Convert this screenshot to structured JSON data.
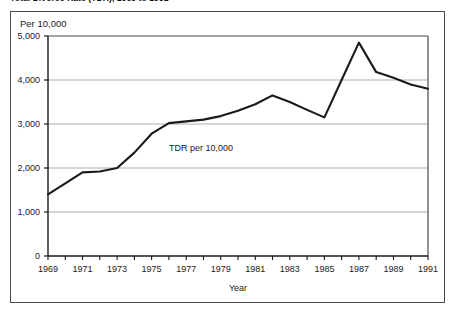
{
  "figure": {
    "title": "Total Divorce Rate (TDR), 1969 to 1991",
    "unit_label": "Per 10,000",
    "annotation": "TDR per 10,000"
  },
  "chart_data": {
    "type": "line",
    "title": "Total Divorce Rate (TDR), 1969 to 1991",
    "xlabel": "Year",
    "ylabel": "Per 10,000",
    "xlim": [
      1969,
      1991
    ],
    "ylim": [
      0,
      5000
    ],
    "grid": true,
    "legend": null,
    "annotations": [
      {
        "text": "TDR per 10,000",
        "x": 1976,
        "y": 2450
      }
    ],
    "y_ticks": [
      0,
      1000,
      2000,
      3000,
      4000,
      5000
    ],
    "y_tick_labels": [
      "0",
      "1,000",
      "2,000",
      "3,000",
      "4,000",
      "5,000"
    ],
    "x_ticks": [
      1969,
      1970,
      1971,
      1972,
      1973,
      1974,
      1975,
      1976,
      1977,
      1978,
      1979,
      1980,
      1981,
      1982,
      1983,
      1984,
      1985,
      1986,
      1987,
      1988,
      1989,
      1990,
      1991
    ],
    "x_tick_labels": [
      "1969",
      "",
      "1971",
      "",
      "1973",
      "",
      "1975",
      "",
      "1977",
      "",
      "1979",
      "",
      "1981",
      "",
      "1983",
      "",
      "1985",
      "",
      "1987",
      "",
      "1989",
      "",
      "1991"
    ],
    "series": [
      {
        "name": "TDR per 10,000",
        "color": "#1a1a1a",
        "x": [
          1969,
          1970,
          1971,
          1972,
          1973,
          1974,
          1975,
          1976,
          1977,
          1978,
          1979,
          1980,
          1981,
          1982,
          1983,
          1984,
          1985,
          1986,
          1987,
          1988,
          1989,
          1990,
          1991
        ],
        "values": [
          1400,
          1650,
          1900,
          1920,
          2000,
          2350,
          2780,
          3020,
          3060,
          3100,
          3180,
          3300,
          3450,
          3650,
          3500,
          3320,
          3150,
          4000,
          4850,
          4180,
          4050,
          3900,
          3800
        ]
      }
    ]
  }
}
